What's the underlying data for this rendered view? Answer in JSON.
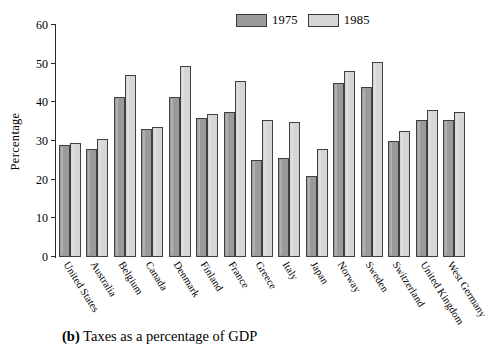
{
  "caption": {
    "marker": "(b)",
    "text": "Taxes as a percentage of GDP"
  },
  "legend": [
    {
      "label": "1975",
      "color": "#9a9a9a",
      "name": "legend-swatch-1975"
    },
    {
      "label": "1985",
      "color": "#d6d6d6",
      "name": "legend-swatch-1985"
    }
  ],
  "axis": {
    "ylabel": "Percentage",
    "yticks": [
      "0",
      "10",
      "20",
      "30",
      "40",
      "50",
      "60"
    ]
  },
  "chart_data": {
    "type": "bar",
    "title": "Taxes as a percentage of GDP",
    "xlabel": "",
    "ylabel": "Percentage",
    "ylim": [
      0,
      60
    ],
    "ytick_step": 10,
    "grid": false,
    "legend_position": "top-center",
    "categories": [
      "United States",
      "Australia",
      "Belgium",
      "Canada",
      "Denmark",
      "Finland",
      "France",
      "Greece",
      "Italy",
      "Japan",
      "Norway",
      "Sweden",
      "Switzerland",
      "United Kingdom",
      "West Germany"
    ],
    "series": [
      {
        "name": "1975",
        "color": "#9a9a9a",
        "values": [
          29,
          28,
          41.5,
          33,
          41.5,
          36,
          37.5,
          25,
          25.5,
          21,
          45,
          44,
          30,
          35.5,
          35.5
        ]
      },
      {
        "name": "1985",
        "color": "#d6d6d6",
        "values": [
          29.5,
          30.5,
          47,
          33.5,
          49.5,
          37,
          45.5,
          35.5,
          35,
          28,
          48,
          50.5,
          32.5,
          38,
          37.5
        ]
      }
    ]
  }
}
